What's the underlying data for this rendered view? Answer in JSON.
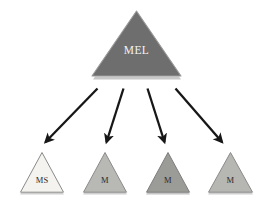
{
  "diagram": {
    "type": "hierarchy-tree",
    "background_color": "#ffffff",
    "root": {
      "id": "mel",
      "label": "MEL",
      "shape": "triangle",
      "fill_color": "#6e6e6e",
      "stroke_color": "#9a9a9a",
      "text_color": "#f2f2f2",
      "shadow_color": "#c8c8c8"
    },
    "children": [
      {
        "id": "child-1",
        "label": "MS",
        "shape": "triangle",
        "fill_color": "#f4f3ef",
        "stroke_color": "#8a8a8a",
        "text_color": "#2b2b2b",
        "shadow_color": "#cfcfcf"
      },
      {
        "id": "child-2",
        "label": "M",
        "shape": "triangle",
        "fill_color": "#b8b8b4",
        "stroke_color": "#8a8a8a",
        "text_color": "#2b2b2b",
        "shadow_color": "#cfcfcf"
      },
      {
        "id": "child-3",
        "label": "M",
        "shape": "triangle",
        "fill_color": "#9b9b97",
        "stroke_color": "#7d7d7d",
        "text_color": "#2b2b2b",
        "shadow_color": "#c4c4c4"
      },
      {
        "id": "child-4",
        "label": "M",
        "shape": "triangle",
        "fill_color": "#b6b6b2",
        "stroke_color": "#8a8a8a",
        "text_color": "#2b2b2b",
        "shadow_color": "#cfcfcf"
      }
    ],
    "connectors": {
      "count": 4,
      "style": "solid-arrow",
      "color": "#171717",
      "direction": "root-to-child"
    }
  }
}
